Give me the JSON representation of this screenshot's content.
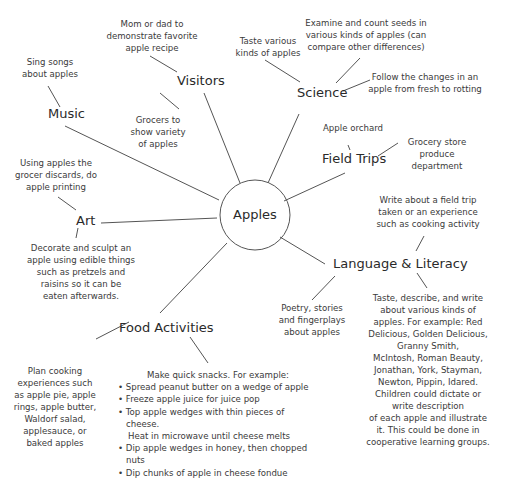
{
  "center": {
    "label": "Apples"
  },
  "categories": {
    "visitors": {
      "label": "Visitors",
      "notes": [
        "Mom or dad to demonstrate favorite apple recipe",
        "Grocers to show variety of apples"
      ]
    },
    "science": {
      "label": "Science",
      "notes": [
        "Taste various kinds of apples",
        "Examine and count seeds in various kinds of apples (can compare other differences)",
        "Follow the changes in an apple from fresh to rotting"
      ]
    },
    "music": {
      "label": "Music",
      "notes": [
        "Sing songs about apples"
      ]
    },
    "field_trips": {
      "label": "Field Trips",
      "notes": [
        "Apple orchard",
        "Grocery store produce department"
      ]
    },
    "art": {
      "label": "Art",
      "notes": [
        "Using apples the grocer discards, do apple printing",
        "Decorate and sculpt an apple using edible things such as pretzels and raisins so it can be eaten afterwards."
      ]
    },
    "language_literacy": {
      "label": "Language & Literacy",
      "notes": [
        "Write about a field trip taken or an experience such as cooking activity",
        "Poetry, stories and fingerplays about apples",
        "Taste, describe, and write about various kinds of apples. For example: Red Delicious, Golden Delicious, Granny Smith, McIntosh, Roman Beauty, Jonathan, York, Stayman, Newton, Pippin, Idared. Children could dictate or write description of each apple and illustrate it. This could be done in cooperative learning groups."
      ]
    },
    "food_activities": {
      "label": "Food Activities",
      "notes": [
        "Plan cooking experiences such as apple pie, apple rings, apple butter, Waldorf salad, applesauce, or baked apples"
      ],
      "snacks": {
        "heading": "Make quick snacks. For example:",
        "items": [
          "Spread peanut butter on a wedge of apple",
          "Freeze apple juice for juice pop",
          "Top apple wedges with thin pieces of cheese. Heat in microwave until cheese melts",
          "Dip apple wedges in honey, then chopped nuts",
          "Dip chunks of apple in cheese fondue"
        ]
      }
    }
  },
  "text_lines": {
    "visitors_n0": [
      "Mom or dad to",
      "demonstrate favorite",
      "apple recipe"
    ],
    "visitors_n1": [
      "Grocers to",
      "show variety",
      "of apples"
    ],
    "science_n0": [
      "Taste various",
      "kinds of apples"
    ],
    "science_n1": [
      "Examine and count seeds in",
      "various kinds of apples (can",
      "compare other differences)"
    ],
    "science_n2": [
      "Follow the changes in an",
      "apple from fresh to rotting"
    ],
    "music_n0": [
      "Sing songs",
      "about apples"
    ],
    "field_n0": [
      "Apple orchard"
    ],
    "field_n1": [
      "Grocery store",
      "produce",
      "department"
    ],
    "art_n0": [
      "Using apples the",
      "grocer discards, do",
      "apple printing"
    ],
    "art_n1": [
      "Decorate and sculpt an",
      "apple using edible things",
      "such as pretzels and",
      "raisins so it can be",
      "eaten afterwards."
    ],
    "lang_n0": [
      "Write about a field trip",
      "taken or an experience",
      "such as cooking activity"
    ],
    "lang_n1": [
      "Poetry, stories",
      "and fingerplays",
      "about apples"
    ],
    "lang_n2": [
      "Taste, describe, and write",
      "about various kinds of",
      "apples. For example: Red",
      "Delicious, Golden Delicious,",
      "Granny Smith,",
      "McIntosh, Roman Beauty,",
      "Jonathan, York, Stayman,",
      "Newton, Pippin, Idared.",
      "Children could dictate or",
      "write description",
      "of each apple and illustrate",
      "it.  This could be done in",
      "cooperative learning groups."
    ],
    "food_n0": [
      "Plan cooking",
      "experiences such",
      "as apple pie, apple",
      "rings, apple butter,",
      "Waldorf salad,",
      "applesauce, or",
      "baked apples"
    ],
    "snack_items": [
      "Spread peanut butter on a wedge of apple",
      "Freeze apple juice for juice pop",
      "Top apple wedges with thin pieces of cheese.",
      "Heat in microwave until cheese melts",
      "Dip apple wedges in honey, then chopped nuts",
      "Dip chunks of apple in cheese fondue"
    ]
  },
  "colors": {
    "line": "#555555",
    "text": "#2a2a2a",
    "background": "#ffffff"
  }
}
